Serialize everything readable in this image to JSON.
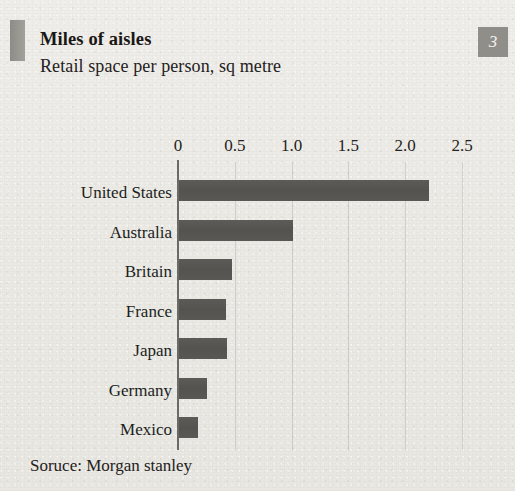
{
  "header": {
    "badge_number": "3",
    "title": "Miles of aisles",
    "subtitle": "Retail space per person, sq metre"
  },
  "footer": {
    "source": "Soruce: Morgan stanley"
  },
  "colors": {
    "background": "#eceae5",
    "bar": "#585653",
    "badge": "#908e89",
    "rule": "#8e8c87",
    "text": "#1d1b19",
    "gridline": "#969488"
  },
  "chart_data": {
    "type": "bar",
    "orientation": "horizontal",
    "title": "Miles of aisles",
    "subtitle": "Retail space per person, sq metre",
    "xlabel": "",
    "ylabel": "",
    "categories": [
      "United States",
      "Australia",
      "Britain",
      "France",
      "Japan",
      "Germany",
      "Mexico"
    ],
    "values": [
      2.2,
      1.0,
      0.47,
      0.41,
      0.42,
      0.25,
      0.17
    ],
    "xlim": [
      0,
      2.5
    ],
    "ticks": [
      "0",
      "0.5",
      "1.0",
      "1.5",
      "2.0",
      "2.5"
    ],
    "tick_values": [
      0,
      0.5,
      1.0,
      1.5,
      2.0,
      2.5
    ],
    "grid": true,
    "legend": "none",
    "source": "Soruce: Morgan stanley"
  }
}
